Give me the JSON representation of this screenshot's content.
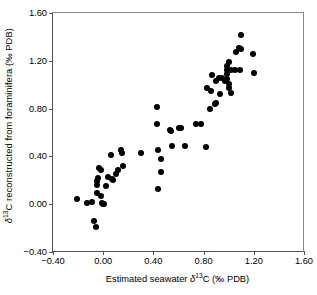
{
  "chart_data": {
    "type": "scatter",
    "title": "",
    "xlabel": "Estimated seawater δ13C (‰ PDB)",
    "ylabel": "δ13C reconstructed from foraminifera (‰ PDB)",
    "xlim": [
      -0.4,
      1.6
    ],
    "ylim": [
      -0.4,
      1.6
    ],
    "xticks": [
      "-0.40",
      "0.00",
      "0.40",
      "0.80",
      "1.20",
      "1.60"
    ],
    "yticks": [
      "-0.40",
      "0.00",
      "0.40",
      "0.80",
      "1.20",
      "1.60"
    ],
    "xtick_values": [
      -0.4,
      0.0,
      0.4,
      0.8,
      1.2,
      1.6
    ],
    "ytick_values": [
      -0.4,
      0.0,
      0.4,
      0.8,
      1.2,
      1.6
    ],
    "grid": false,
    "legend": null,
    "marker": "filled-circle",
    "marker_color": "#000000",
    "series": [
      {
        "name": "samples",
        "points": [
          [
            -0.21,
            0.04
          ],
          [
            -0.13,
            0.01
          ],
          [
            -0.09,
            0.02
          ],
          [
            -0.07,
            -0.14
          ],
          [
            -0.06,
            -0.19
          ],
          [
            -0.05,
            0.16
          ],
          [
            -0.05,
            0.19
          ],
          [
            -0.05,
            0.09
          ],
          [
            -0.04,
            0.22
          ],
          [
            -0.03,
            0.3
          ],
          [
            -0.02,
            0.29
          ],
          [
            -0.02,
            0.07
          ],
          [
            -0.01,
            0.01
          ],
          [
            0.0,
            0.0
          ],
          [
            0.01,
            0.0
          ],
          [
            0.02,
            0.15
          ],
          [
            0.04,
            0.23
          ],
          [
            0.06,
            0.41
          ],
          [
            0.07,
            0.21
          ],
          [
            0.08,
            0.2
          ],
          [
            0.1,
            0.25
          ],
          [
            0.12,
            0.29
          ],
          [
            0.14,
            0.45
          ],
          [
            0.15,
            0.43
          ],
          [
            0.16,
            0.32
          ],
          [
            0.3,
            0.43
          ],
          [
            0.43,
            0.81
          ],
          [
            0.43,
            0.67
          ],
          [
            0.44,
            0.45
          ],
          [
            0.44,
            0.13
          ],
          [
            0.46,
            0.38
          ],
          [
            0.46,
            0.27
          ],
          [
            0.53,
            0.62
          ],
          [
            0.54,
            0.61
          ],
          [
            0.55,
            0.49
          ],
          [
            0.6,
            0.64
          ],
          [
            0.62,
            0.64
          ],
          [
            0.65,
            0.49
          ],
          [
            0.74,
            0.67
          ],
          [
            0.78,
            0.67
          ],
          [
            0.82,
            0.48
          ],
          [
            0.83,
            0.97
          ],
          [
            0.85,
            0.8
          ],
          [
            0.86,
            0.95
          ],
          [
            0.87,
            1.08
          ],
          [
            0.89,
            0.84
          ],
          [
            0.9,
            1.03
          ],
          [
            0.9,
            0.85
          ],
          [
            0.92,
            1.06
          ],
          [
            0.93,
            0.92
          ],
          [
            0.95,
            1.06
          ],
          [
            0.97,
            1.03
          ],
          [
            0.99,
            1.16
          ],
          [
            0.99,
            1.12
          ],
          [
            0.99,
            1.09
          ],
          [
            0.99,
            1.05
          ],
          [
            1.0,
            1.01
          ],
          [
            1.0,
            0.97
          ],
          [
            1.0,
            1.19
          ],
          [
            1.02,
            1.12
          ],
          [
            1.02,
            0.93
          ],
          [
            1.05,
            1.12
          ],
          [
            1.06,
            1.27
          ],
          [
            1.08,
            1.31
          ],
          [
            1.09,
            1.12
          ],
          [
            1.1,
            1.42
          ],
          [
            1.1,
            1.3
          ],
          [
            1.19,
            1.26
          ],
          [
            1.2,
            1.1
          ]
        ]
      }
    ]
  }
}
